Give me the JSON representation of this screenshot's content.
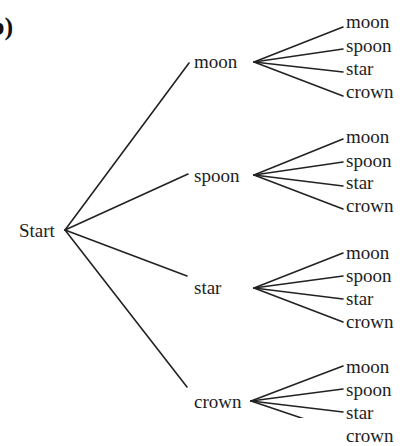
{
  "figure": {
    "part_marker": "b)",
    "root": {
      "label": "Start",
      "x": 19,
      "y": 221,
      "jx": 65,
      "jy": 230
    },
    "branches": [
      {
        "label": "moon",
        "x": 194,
        "y": 52,
        "in_x": 189,
        "in_y": 63,
        "jx": 254,
        "jy": 62,
        "leaves": [
          {
            "label": "moon",
            "x": 346,
            "y": 12,
            "ex": 343,
            "ey": 27
          },
          {
            "label": "spoon",
            "x": 346,
            "y": 36,
            "ex": 343,
            "ey": 49
          },
          {
            "label": "star",
            "x": 346,
            "y": 59,
            "ex": 343,
            "ey": 72
          },
          {
            "label": "crown",
            "x": 346,
            "y": 82,
            "ex": 343,
            "ey": 96
          }
        ]
      },
      {
        "label": "spoon",
        "x": 194,
        "y": 166,
        "in_x": 188,
        "in_y": 174,
        "jx": 254,
        "jy": 175,
        "leaves": [
          {
            "label": "moon",
            "x": 346,
            "y": 127,
            "ex": 343,
            "ey": 139
          },
          {
            "label": "spoon",
            "x": 346,
            "y": 151,
            "ex": 343,
            "ey": 162
          },
          {
            "label": "star",
            "x": 346,
            "y": 173,
            "ex": 343,
            "ey": 186
          },
          {
            "label": "crown",
            "x": 346,
            "y": 196,
            "ex": 343,
            "ey": 209
          }
        ]
      },
      {
        "label": "star",
        "x": 194,
        "y": 278,
        "in_x": 187,
        "in_y": 276,
        "jx": 254,
        "jy": 288,
        "leaves": [
          {
            "label": "moon",
            "x": 346,
            "y": 243,
            "ex": 343,
            "ey": 253
          },
          {
            "label": "spoon",
            "x": 346,
            "y": 266,
            "ex": 343,
            "ey": 276
          },
          {
            "label": "star",
            "x": 346,
            "y": 289,
            "ex": 343,
            "ey": 299
          },
          {
            "label": "crown",
            "x": 346,
            "y": 312,
            "ex": 343,
            "ey": 322
          }
        ]
      },
      {
        "label": "crown",
        "x": 194,
        "y": 392,
        "in_x": 187,
        "in_y": 387,
        "jx": 251,
        "jy": 401,
        "leaves": [
          {
            "label": "moon",
            "x": 346,
            "y": 357,
            "ex": 343,
            "ey": 366
          },
          {
            "label": "spoon",
            "x": 346,
            "y": 380,
            "ex": 343,
            "ey": 389
          },
          {
            "label": "star",
            "x": 346,
            "y": 403,
            "ex": 343,
            "ey": 412
          },
          {
            "label": "crown",
            "x": 346,
            "y": 426,
            "ex": 343,
            "ey": 432
          }
        ]
      }
    ]
  }
}
